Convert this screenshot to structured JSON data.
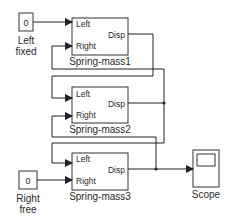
{
  "diagram": {
    "type": "simulink-block-diagram",
    "line_color": "#222222",
    "background": "#ffffff",
    "constants": [
      {
        "id": "left-fixed",
        "value": "0",
        "label_line1": "Left",
        "label_line2": "fixed"
      },
      {
        "id": "right-free",
        "value": "0",
        "label_line1": "Right",
        "label_line2": "free"
      }
    ],
    "subsystems": [
      {
        "id": "spring-mass1",
        "name": "Spring-mass1",
        "in1": "Left",
        "in2": "Right",
        "out": "Disp"
      },
      {
        "id": "spring-mass2",
        "name": "Spring-mass2",
        "in1": "Left",
        "in2": "Right",
        "out": "Disp"
      },
      {
        "id": "spring-mass3",
        "name": "Spring-mass3",
        "in1": "Left",
        "in2": "Right",
        "out": "Disp"
      }
    ],
    "scope": {
      "name": "Scope"
    },
    "connections": [
      "Left fixed -> Spring-mass1.Left",
      "Spring-mass2.Disp -> Spring-mass1.Right",
      "Spring-mass1.Disp -> Spring-mass2.Left",
      "Spring-mass3.Disp -> Spring-mass2.Right",
      "Spring-mass2.Disp -> Spring-mass3.Left",
      "Right free -> Spring-mass3.Right",
      "Spring-mass3.Disp -> Scope"
    ]
  }
}
